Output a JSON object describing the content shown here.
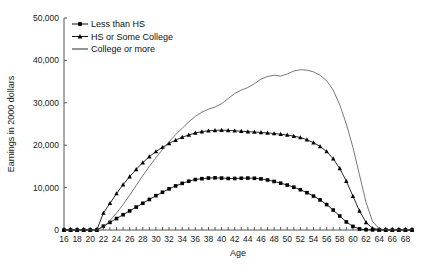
{
  "chart_data": {
    "type": "line",
    "title": "",
    "xlabel": "Age",
    "ylabel": "Earnings in 2000 dollars",
    "xlim": [
      16,
      69
    ],
    "ylim": [
      0,
      50000
    ],
    "xticks": [
      16,
      18,
      20,
      22,
      24,
      26,
      28,
      30,
      32,
      34,
      36,
      38,
      40,
      42,
      44,
      46,
      48,
      50,
      52,
      54,
      56,
      58,
      60,
      62,
      64,
      66,
      68
    ],
    "yticks": [
      0,
      10000,
      20000,
      30000,
      40000,
      50000
    ],
    "yticklabels": [
      "0",
      "10,000",
      "20,000",
      "30,000",
      "40,000",
      "50,000"
    ],
    "grid": false,
    "legend_position": "top-left",
    "x": [
      16,
      17,
      18,
      19,
      20,
      21,
      22,
      23,
      24,
      25,
      26,
      27,
      28,
      29,
      30,
      31,
      32,
      33,
      34,
      35,
      36,
      37,
      38,
      39,
      40,
      41,
      42,
      43,
      44,
      45,
      46,
      47,
      48,
      49,
      50,
      51,
      52,
      53,
      54,
      55,
      56,
      57,
      58,
      59,
      60,
      61,
      62,
      63,
      64,
      65,
      66,
      67,
      68,
      69
    ],
    "series": [
      {
        "name": "Less than HS",
        "marker": "square",
        "values": [
          0,
          0,
          0,
          0,
          0,
          0,
          900,
          1800,
          2700,
          3600,
          4500,
          5400,
          6300,
          7200,
          8100,
          8900,
          9700,
          10400,
          11000,
          11500,
          11900,
          12100,
          12250,
          12300,
          12250,
          12150,
          12150,
          12200,
          12250,
          12200,
          12050,
          11800,
          11450,
          11050,
          10600,
          10100,
          9500,
          8800,
          8000,
          7100,
          6000,
          4700,
          3300,
          1900,
          850,
          250,
          60,
          20,
          10,
          5,
          5,
          5,
          5,
          5
        ]
      },
      {
        "name": "HS or Some College",
        "marker": "triangle",
        "values": [
          0,
          0,
          0,
          0,
          0,
          0,
          4000,
          6300,
          8600,
          10700,
          12600,
          14300,
          15900,
          17300,
          18500,
          19500,
          20400,
          21200,
          21900,
          22400,
          22900,
          23200,
          23400,
          23500,
          23550,
          23500,
          23400,
          23300,
          23200,
          23100,
          23000,
          22900,
          22750,
          22600,
          22400,
          22150,
          21800,
          21300,
          20600,
          19700,
          18500,
          16800,
          14500,
          11500,
          8000,
          4500,
          1800,
          400,
          80,
          20,
          10,
          10,
          10,
          10
        ]
      },
      {
        "name": "College or more",
        "marker": "none",
        "values": [
          0,
          0,
          0,
          0,
          0,
          0,
          700,
          2200,
          4000,
          6000,
          8200,
          10500,
          12800,
          15000,
          17000,
          19000,
          20800,
          22500,
          24000,
          25500,
          26800,
          27800,
          28500,
          29000,
          29800,
          31000,
          32200,
          33000,
          33600,
          34500,
          35600,
          36200,
          36500,
          36300,
          36800,
          37500,
          37800,
          37700,
          37300,
          36500,
          35200,
          33000,
          29500,
          25000,
          19500,
          13000,
          6500,
          2000,
          300,
          50,
          20,
          20,
          20,
          20
        ]
      }
    ],
    "legend": [
      "Less than HS",
      "HS or Some College",
      "College or more"
    ]
  }
}
